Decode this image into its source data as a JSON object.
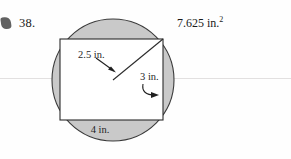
{
  "page": {
    "background_color": "#fefefe",
    "ruled_line_color": "#e2e0e0"
  },
  "problem": {
    "number": "38.",
    "answer": "7.625 in.",
    "answer_exponent": "2"
  },
  "figure": {
    "type": "circle-with-inscribed-rectangle",
    "circle": {
      "center_x": 113,
      "center_y": 80,
      "radius": 61,
      "shaded_fill": "#c9c9c9",
      "stroke": "#3a3a3a"
    },
    "rectangle": {
      "left": 60,
      "top": 39,
      "right": 163,
      "bottom": 120,
      "fill": "#ffffff",
      "stroke": "#2b2b2b"
    },
    "radius_segment": {
      "from_x": 113,
      "from_y": 80,
      "to_x": 163,
      "to_y": 39
    },
    "labels": {
      "radius_label": "2.5 in.",
      "height_label": "3 in.",
      "width_label": "4 in."
    },
    "annotations": {
      "radius_arrow": "straight-arrow-down-right",
      "height_arrow": "curved-arrow-right",
      "width_arrow": "none"
    }
  },
  "icons": {
    "margin_artifact": "scan-artifact-blob"
  }
}
